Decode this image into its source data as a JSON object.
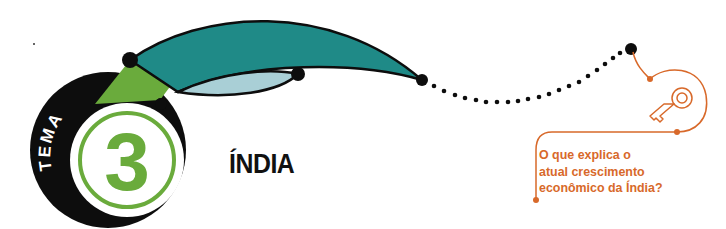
{
  "badge": {
    "label": "TEMA",
    "number": "3"
  },
  "header": {
    "title": "ÍNDIA"
  },
  "question": {
    "icon": "key-icon",
    "text": "O que explica o atual crescimento econômico da Índia?",
    "lines": [
      "O que explica o",
      "atual crescimento",
      "econômico da Índia?"
    ]
  },
  "colors": {
    "teal": "#1f8a87",
    "light_blue": "#a9cfd6",
    "green": "#6aab3c",
    "black": "#0d0d0d",
    "orange": "#d8692a"
  }
}
